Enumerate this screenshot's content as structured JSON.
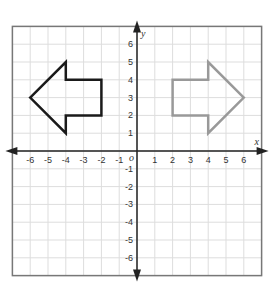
{
  "chart_data": {
    "type": "coordinate-plane",
    "title": "",
    "xlabel": "x",
    "ylabel": "y",
    "origin_label": "o",
    "xlim": [
      -7,
      7
    ],
    "ylim": [
      -7,
      7
    ],
    "grid": true,
    "x_ticks": [
      -6,
      -5,
      -4,
      -3,
      -2,
      -1,
      1,
      2,
      3,
      4,
      5,
      6
    ],
    "y_ticks": [
      -6,
      -5,
      -4,
      -3,
      -2,
      -1,
      1,
      2,
      3,
      4,
      5,
      6
    ],
    "shapes": [
      {
        "name": "left-arrow",
        "color": "#1a1a1a",
        "points": [
          [
            -6,
            3
          ],
          [
            -4,
            5
          ],
          [
            -4,
            4
          ],
          [
            -2,
            4
          ],
          [
            -2,
            2
          ],
          [
            -4,
            2
          ],
          [
            -4,
            1
          ]
        ]
      },
      {
        "name": "right-arrow",
        "color": "#999999",
        "points": [
          [
            6,
            3
          ],
          [
            4,
            5
          ],
          [
            4,
            4
          ],
          [
            2,
            4
          ],
          [
            2,
            2
          ],
          [
            4,
            2
          ],
          [
            4,
            1
          ]
        ]
      }
    ]
  },
  "colors": {
    "grid": "#dddddd",
    "border": "#777777",
    "axis": "#222222",
    "left_shape": "#1a1a1a",
    "right_shape": "#999999"
  }
}
